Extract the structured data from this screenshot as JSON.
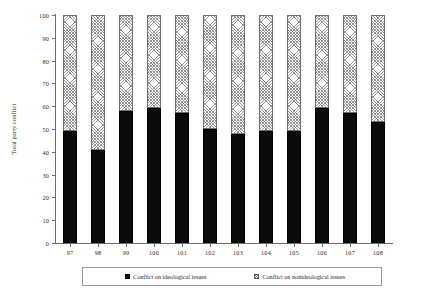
{
  "chart_data": {
    "type": "bar",
    "stacked": true,
    "title": "",
    "xlabel": "",
    "ylabel": "Total party conflict",
    "ylim": [
      0,
      100
    ],
    "yticks": [
      0,
      10,
      20,
      30,
      40,
      50,
      60,
      70,
      80,
      90,
      100
    ],
    "grid": false,
    "legend_position": "bottom",
    "categories": [
      "97",
      "98",
      "99",
      "100",
      "101",
      "102",
      "103",
      "104",
      "105",
      "106",
      "107",
      "108"
    ],
    "series": [
      {
        "name": "Conflict on ideological issues",
        "fill": "solid-black",
        "color": "#0b0b0b",
        "values": [
          49,
          41,
          58,
          59,
          57,
          50,
          48,
          49,
          49,
          59,
          57,
          53
        ]
      },
      {
        "name": "Conflict on nonideological issues",
        "fill": "hatched-gray",
        "color": "#8c8c8c",
        "values": [
          51,
          59,
          42,
          41,
          43,
          50,
          52,
          51,
          51,
          41,
          43,
          47
        ]
      }
    ]
  },
  "legend": {
    "items": [
      {
        "label": "Conflict on ideological issues",
        "swatch": "solid-black"
      },
      {
        "label": "Conflict on nonideological issues",
        "swatch": "hatched-gray"
      }
    ]
  }
}
